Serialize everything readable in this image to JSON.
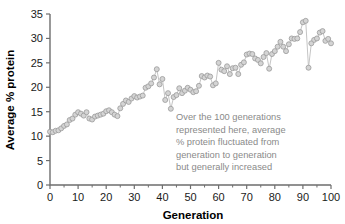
{
  "chart_data": {
    "type": "scatter",
    "title": "",
    "xlabel": "Generation",
    "ylabel": "Average % protein",
    "xlim": [
      0,
      100
    ],
    "ylim": [
      0,
      35
    ],
    "grid": false,
    "legend": null,
    "x_ticks": [
      0,
      10,
      20,
      30,
      40,
      50,
      60,
      70,
      80,
      90,
      100
    ],
    "x_tick_labels": [
      "0",
      "10",
      "20",
      "30",
      "40",
      "50",
      "60",
      "70",
      "80",
      "90",
      "100"
    ],
    "x_minor_ticks": [
      5,
      15,
      25,
      35,
      45,
      55,
      65,
      75,
      85,
      95
    ],
    "y_ticks": [
      0,
      5,
      10,
      15,
      20,
      25,
      30,
      35
    ],
    "y_tick_labels": [
      "0",
      "5",
      "10",
      "15",
      "20",
      "25",
      "30",
      "35"
    ],
    "marker_fill": "#d4d4d4",
    "marker_edge": "#9a9a9a",
    "line_color": "#bdbdbd",
    "annotation": {
      "lines": [
        "Over the 100 generations",
        "represented here, average",
        "% protein fluctuated from",
        "generation to generation",
        "but generally increased"
      ],
      "color": "#8a8a8a"
    },
    "x": [
      0,
      1,
      2,
      3,
      4,
      5,
      6,
      7,
      8,
      9,
      10,
      11,
      12,
      13,
      14,
      15,
      16,
      17,
      18,
      19,
      20,
      21,
      22,
      23,
      24,
      25,
      26,
      27,
      28,
      29,
      30,
      31,
      32,
      33,
      34,
      35,
      36,
      37,
      38,
      39,
      40,
      41,
      42,
      43,
      44,
      45,
      46,
      47,
      48,
      49,
      50,
      51,
      52,
      53,
      54,
      55,
      56,
      57,
      58,
      59,
      60,
      61,
      62,
      63,
      64,
      65,
      66,
      67,
      68,
      69,
      70,
      71,
      72,
      73,
      74,
      75,
      76,
      77,
      78,
      79,
      80,
      81,
      82,
      83,
      84,
      85,
      86,
      87,
      88,
      89,
      90,
      91,
      92,
      93,
      94,
      95,
      96,
      97,
      98,
      99,
      100
    ],
    "values": [
      10.9,
      10.8,
      11.1,
      11.2,
      11.6,
      12.1,
      12.4,
      13.3,
      13.6,
      14.4,
      14.9,
      14.6,
      14.2,
      14.9,
      13.6,
      13.4,
      14.0,
      14.2,
      14.4,
      14.6,
      15.1,
      15.3,
      14.9,
      14.4,
      14.1,
      15.7,
      16.6,
      17.3,
      17.0,
      17.7,
      18.2,
      17.9,
      18.1,
      18.3,
      19.9,
      20.2,
      20.8,
      22.0,
      23.7,
      20.6,
      21.7,
      17.4,
      18.8,
      15.6,
      18.0,
      18.4,
      19.8,
      18.8,
      19.3,
      19.9,
      19.5,
      19.0,
      19.2,
      20.3,
      22.3,
      22.0,
      22.4,
      22.2,
      20.4,
      20.8,
      25.0,
      23.6,
      23.3,
      24.3,
      22.7,
      23.9,
      24.0,
      22.7,
      24.6,
      25.1,
      26.7,
      26.9,
      26.8,
      25.9,
      25.6,
      24.9,
      26.2,
      27.0,
      23.8,
      26.8,
      27.4,
      28.3,
      29.3,
      28.3,
      27.4,
      28.8,
      30.0,
      29.9,
      30.0,
      31.3,
      33.3,
      33.6,
      24.0,
      29.0,
      29.7,
      30.0,
      31.2,
      31.5,
      29.5,
      29.9,
      29.0
    ]
  }
}
